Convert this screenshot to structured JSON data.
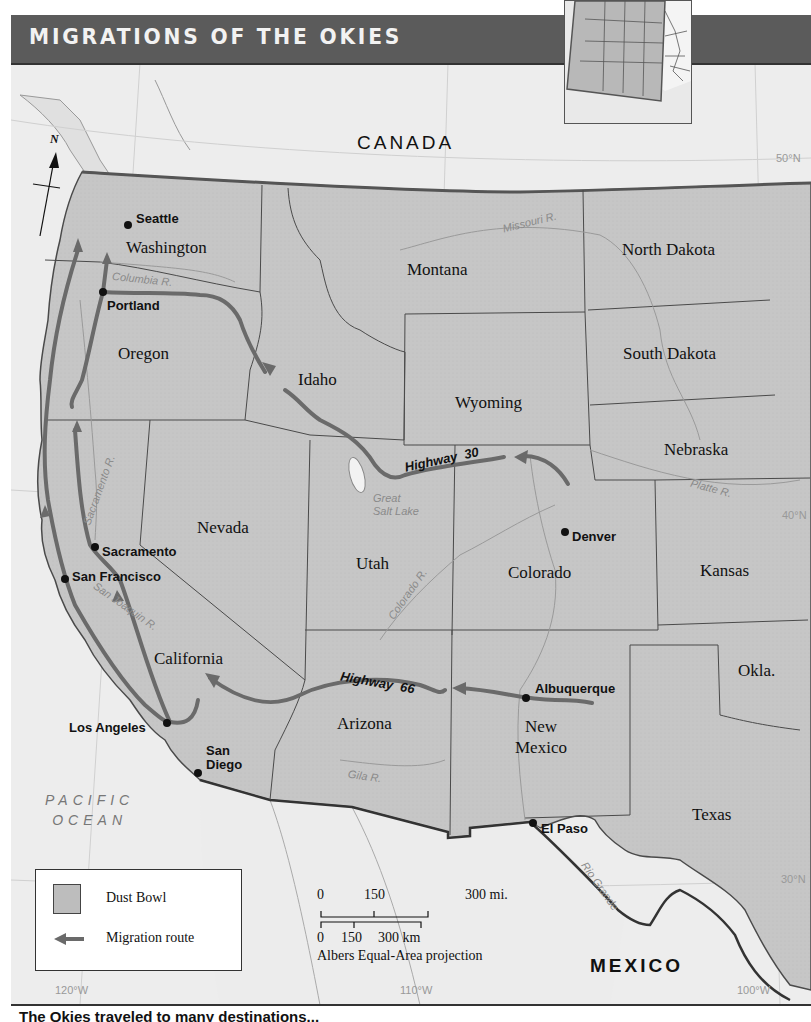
{
  "title": "MIGRATIONS OF THE OKIES",
  "countries": {
    "canada": "CANADA",
    "mexico": "MEXICO"
  },
  "ocean": {
    "line1": "PACIFIC",
    "line2": "OCEAN"
  },
  "compass": {
    "north": "N"
  },
  "states": [
    {
      "name": "Washington"
    },
    {
      "name": "Oregon"
    },
    {
      "name": "Idaho"
    },
    {
      "name": "Montana"
    },
    {
      "name": "Wyoming"
    },
    {
      "name": "North Dakota"
    },
    {
      "name": "South Dakota"
    },
    {
      "name": "Nebraska"
    },
    {
      "name": "Nevada"
    },
    {
      "name": "Utah"
    },
    {
      "name": "Colorado"
    },
    {
      "name": "Kansas"
    },
    {
      "name": "California"
    },
    {
      "name": "Arizona"
    },
    {
      "name": "New Mexico"
    },
    {
      "name": "Okla."
    },
    {
      "name": "Texas"
    }
  ],
  "new_mexico_lines": [
    "New",
    "Mexico"
  ],
  "cities": [
    {
      "name": "Seattle"
    },
    {
      "name": "Portland"
    },
    {
      "name": "Sacramento"
    },
    {
      "name": "San Francisco"
    },
    {
      "name": "Los Angeles"
    },
    {
      "name": "San Diego"
    },
    {
      "name": "Denver"
    },
    {
      "name": "Albuquerque"
    },
    {
      "name": "El Paso"
    }
  ],
  "san_diego_lines": [
    "San",
    "Diego"
  ],
  "rivers": [
    {
      "name": "Columbia R."
    },
    {
      "name": "Missouri R."
    },
    {
      "name": "Sacramento R."
    },
    {
      "name": "San Joaquin R."
    },
    {
      "name": "Colorado R."
    },
    {
      "name": "Platte R."
    },
    {
      "name": "Gila R."
    },
    {
      "name": "Rio Grande"
    }
  ],
  "lakes": {
    "great_salt_lake_line1": "Great",
    "great_salt_lake_line2": "Salt Lake"
  },
  "highways": [
    {
      "label": "Highway",
      "number": "30"
    },
    {
      "label": "Highway",
      "number": "66"
    }
  ],
  "grid_labels": {
    "lat_50": "50°N",
    "lat_40": "40°N",
    "lat_30": "30°N",
    "lon_120": "120°W",
    "lon_110": "110°W",
    "lon_100": "100°W"
  },
  "legend": {
    "items": [
      {
        "label": "Dust Bowl",
        "type": "area-swatch"
      },
      {
        "label": "Migration route",
        "type": "arrow"
      }
    ]
  },
  "scale_bar": {
    "miles": [
      "0",
      "150",
      "300 mi."
    ],
    "km": [
      "0",
      "150",
      "300 km"
    ],
    "projection": "Albers Equal-Area projection"
  },
  "caption": "The Okies traveled to many destinations...",
  "colors": {
    "title_bar": "#5b5b5b",
    "land_us": "#c4c4c4",
    "land_foreign": "#e6e6e6",
    "water": "#efefef",
    "route": "#6a6a6a",
    "border": "#4a4a4a"
  }
}
